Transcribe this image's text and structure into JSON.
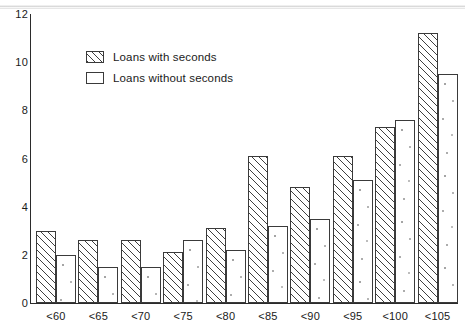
{
  "chart_data": {
    "type": "bar",
    "title": "",
    "xlabel": "",
    "ylabel": "",
    "ylim": [
      0,
      12
    ],
    "yticks": [
      0,
      2,
      4,
      6,
      8,
      10,
      12
    ],
    "grid": false,
    "legend_position": "upper-left-inside",
    "categories": [
      "<60",
      "<65",
      "<70",
      "<75",
      "<80",
      "<85",
      "<90",
      "<95",
      "<100",
      "<105"
    ],
    "series": [
      {
        "name": "Loans with seconds",
        "pattern": "diagonal-hatch",
        "values": [
          3.0,
          2.6,
          2.6,
          2.1,
          3.1,
          6.1,
          4.8,
          6.1,
          7.3,
          11.2
        ]
      },
      {
        "name": "Loans without seconds",
        "pattern": "open",
        "values": [
          2.0,
          1.5,
          1.5,
          2.6,
          2.2,
          3.2,
          3.5,
          5.1,
          7.6,
          9.5
        ]
      }
    ]
  },
  "axes": {
    "y_tick_labels": [
      "12",
      "10",
      "8",
      "6",
      "4",
      "2",
      "0"
    ],
    "x_tick_labels": [
      "<60",
      "<65",
      "<70",
      "<75",
      "<80",
      "<85",
      "<90",
      "<95",
      "<100",
      "<105"
    ]
  },
  "legend": {
    "items": [
      {
        "label": "Loans with seconds",
        "swatch": "hatched-swatch-icon"
      },
      {
        "label": "Loans without seconds",
        "swatch": "open-swatch-icon"
      }
    ]
  },
  "colors": {
    "ink": "#2b2b2b",
    "bar_outline": "#3a3a3a",
    "hatch": "#3f3f3f",
    "background": "#ffffff"
  }
}
